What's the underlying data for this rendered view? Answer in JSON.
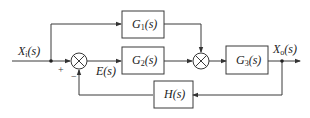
{
  "diagram": {
    "type": "control-system-block-diagram",
    "input": {
      "label": "X",
      "sub": "i",
      "arg": "(s)"
    },
    "output": {
      "label": "X",
      "sub": "o",
      "arg": "(s)"
    },
    "error": {
      "label": "E(s)"
    },
    "blocks": [
      {
        "id": "G1",
        "label": "G",
        "sub": "1",
        "arg": "(s)"
      },
      {
        "id": "G2",
        "label": "G",
        "sub": "2",
        "arg": "(s)"
      },
      {
        "id": "G3",
        "label": "G",
        "sub": "3",
        "arg": "(s)"
      },
      {
        "id": "H",
        "label": "H(s)"
      }
    ],
    "summing_junctions": [
      {
        "id": "S1",
        "signs": {
          "plus": "+",
          "minus": "−"
        }
      },
      {
        "id": "S2",
        "signs": {}
      }
    ],
    "colors": {
      "line": "#3a3a3a",
      "background": "#ffffff"
    }
  }
}
